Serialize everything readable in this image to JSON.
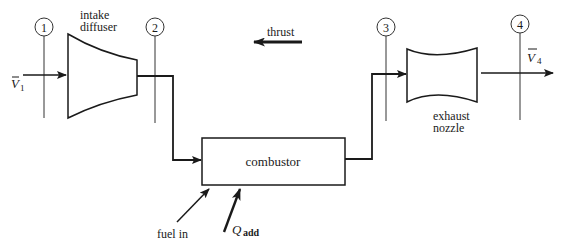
{
  "diagram": {
    "type": "ramjet / turbojet flow schematic",
    "stations": [
      {
        "id": "1",
        "label": "1"
      },
      {
        "id": "2",
        "label": "2"
      },
      {
        "id": "3",
        "label": "3"
      },
      {
        "id": "4",
        "label": "4"
      }
    ],
    "components": {
      "diffuser": {
        "label_line1": "intake",
        "label_line2": "diffuser"
      },
      "combustor": {
        "label": "combustor"
      },
      "nozzle": {
        "label_line1": "exhaust",
        "label_line2": "nozzle"
      }
    },
    "flows": {
      "inlet_velocity": {
        "symbol": "V",
        "subscript": "1"
      },
      "exit_velocity": {
        "symbol": "V",
        "subscript": "4"
      },
      "thrust": {
        "label": "thrust"
      },
      "fuel": {
        "label": "fuel in"
      },
      "heat": {
        "symbol": "Q",
        "subscript": "add"
      }
    },
    "colors": {
      "line": "#1a1a1a",
      "background": "#ffffff"
    }
  }
}
